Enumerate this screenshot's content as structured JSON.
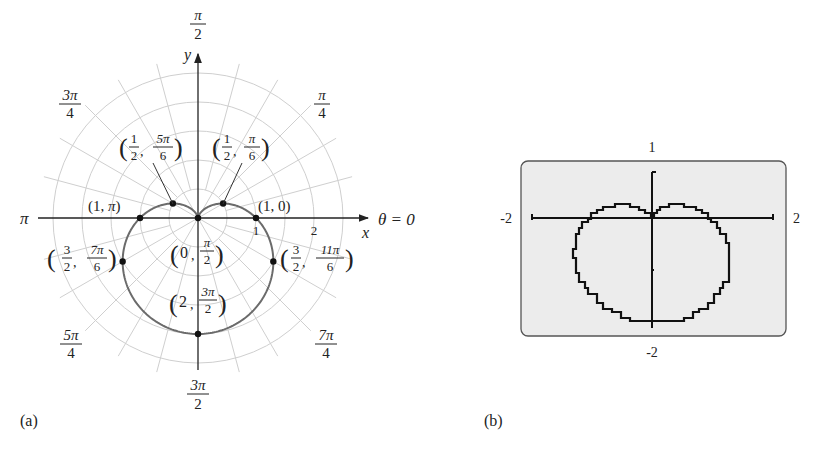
{
  "figure": {
    "equation": "r = 1 - sin θ",
    "panels": [
      {
        "id": "a",
        "label": "(a)"
      },
      {
        "id": "b",
        "label": "(b)"
      }
    ]
  },
  "polar": {
    "axis_labels": {
      "x": "x",
      "y": "y",
      "theta0": "θ = 0",
      "pi": "π"
    },
    "angle_labels": [
      {
        "num": "π",
        "den": "2",
        "angle": "pi/2"
      },
      {
        "num": "π",
        "den": "4",
        "angle": "pi/4"
      },
      {
        "num": "3π",
        "den": "4",
        "angle": "3pi/4"
      },
      {
        "num": "5π",
        "den": "4",
        "angle": "5pi/4"
      },
      {
        "num": "3π",
        "den": "2",
        "angle": "3pi/2"
      },
      {
        "num": "7π",
        "den": "4",
        "angle": "7pi/4"
      }
    ],
    "radius_ticks": [
      "1",
      "2"
    ],
    "grid_radii": [
      0.5,
      1,
      1.5,
      2,
      2.5
    ],
    "points": [
      {
        "r": "1",
        "theta": "0",
        "text_r": "1",
        "text_theta": "0"
      },
      {
        "r": "1",
        "theta": "π",
        "text_r": "1",
        "text_theta": "π"
      },
      {
        "r": "1/2",
        "theta": "π/6",
        "r_num": "1",
        "r_den": "2",
        "t_num": "π",
        "t_den": "6"
      },
      {
        "r": "1/2",
        "theta": "5π/6",
        "r_num": "1",
        "r_den": "2",
        "t_num": "5π",
        "t_den": "6"
      },
      {
        "r": "0",
        "theta": "π/2",
        "r_text": "0",
        "t_num": "π",
        "t_den": "2"
      },
      {
        "r": "3/2",
        "theta": "7π/6",
        "r_num": "3",
        "r_den": "2",
        "t_num": "7π",
        "t_den": "6"
      },
      {
        "r": "3/2",
        "theta": "11π/6",
        "r_num": "3",
        "r_den": "2",
        "t_num": "11π",
        "t_den": "6"
      },
      {
        "r": "2",
        "theta": "3π/2",
        "r_text": "2",
        "t_num": "3π",
        "t_den": "2"
      }
    ],
    "colors": {
      "grid": "#cfcfcf",
      "curve": "#6b6b6b",
      "axis": "#222222"
    }
  },
  "calculator": {
    "window": {
      "xmin": "-2",
      "xmax": "2",
      "ymin": "-2",
      "ymax": "1"
    },
    "colors": {
      "screen": "#ececec",
      "border": "#555555",
      "pixels": "#111111"
    }
  }
}
